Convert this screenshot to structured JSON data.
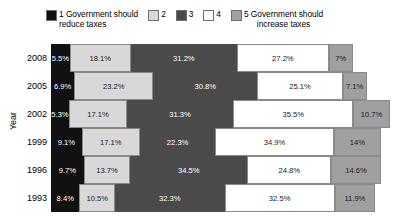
{
  "legend": {
    "items": [
      {
        "key": "1",
        "label": "1 Government should\nreduce taxes",
        "color": "#111111",
        "centered": false
      },
      {
        "key": "2",
        "label": "2",
        "color": "#d8d8d8",
        "centered": false
      },
      {
        "key": "3",
        "label": "3",
        "color": "#4a4a4a",
        "centered": false
      },
      {
        "key": "4",
        "label": "4",
        "color": "#ffffff",
        "centered": false
      },
      {
        "key": "5",
        "label": "5 Government should\nincrease taxes",
        "color": "#a0a0a0",
        "centered": true
      }
    ]
  },
  "axis": {
    "y_title": "Year"
  },
  "chart_data": {
    "type": "bar",
    "orientation": "horizontal",
    "stacked": true,
    "stack_total": 100,
    "title": "",
    "xlabel": "",
    "ylabel": "Year",
    "xlim": [
      0,
      100
    ],
    "grid": false,
    "legend_position": "top",
    "categories": [
      "2008",
      "2005",
      "2002",
      "1999",
      "1996",
      "1993"
    ],
    "series": [
      {
        "name": "1 Government should reduce taxes",
        "color": "#111111",
        "values": [
          5.5,
          6.9,
          5.3,
          9.1,
          9.7,
          8.4
        ]
      },
      {
        "name": "2",
        "color": "#d8d8d8",
        "values": [
          18.1,
          23.2,
          17.1,
          17.1,
          13.7,
          10.5
        ]
      },
      {
        "name": "3",
        "color": "#4a4a4a",
        "values": [
          31.2,
          30.8,
          31.3,
          22.3,
          34.5,
          32.3
        ]
      },
      {
        "name": "4",
        "color": "#ffffff",
        "values": [
          27.2,
          25.1,
          35.5,
          34.9,
          24.8,
          32.5
        ]
      },
      {
        "name": "5 Government should increase taxes",
        "color": "#a0a0a0",
        "values": [
          7,
          7.1,
          10.7,
          14,
          14.6,
          11.9
        ]
      }
    ],
    "rows": [
      {
        "year": "2008",
        "segments": [
          {
            "cat": "1",
            "value": 5.5,
            "label": "5.5%"
          },
          {
            "cat": "2",
            "value": 18.1,
            "label": "18.1%"
          },
          {
            "cat": "3",
            "value": 31.2,
            "label": "31.2%"
          },
          {
            "cat": "4",
            "value": 27.2,
            "label": "27.2%"
          },
          {
            "cat": "5",
            "value": 7,
            "label": "7%"
          }
        ]
      },
      {
        "year": "2005",
        "segments": [
          {
            "cat": "1",
            "value": 6.9,
            "label": "6.9%"
          },
          {
            "cat": "2",
            "value": 23.2,
            "label": "23.2%"
          },
          {
            "cat": "3",
            "value": 30.8,
            "label": "30.8%"
          },
          {
            "cat": "4",
            "value": 25.1,
            "label": "25.1%"
          },
          {
            "cat": "5",
            "value": 7.1,
            "label": "7.1%"
          }
        ]
      },
      {
        "year": "2002",
        "segments": [
          {
            "cat": "1",
            "value": 5.3,
            "label": "5.3%"
          },
          {
            "cat": "2",
            "value": 17.1,
            "label": "17.1%"
          },
          {
            "cat": "3",
            "value": 31.3,
            "label": "31.3%"
          },
          {
            "cat": "4",
            "value": 35.5,
            "label": "35.5%"
          },
          {
            "cat": "5",
            "value": 10.7,
            "label": "10.7%"
          }
        ]
      },
      {
        "year": "1999",
        "segments": [
          {
            "cat": "1",
            "value": 9.1,
            "label": "9.1%"
          },
          {
            "cat": "2",
            "value": 17.1,
            "label": "17.1%"
          },
          {
            "cat": "3",
            "value": 22.3,
            "label": "22.3%"
          },
          {
            "cat": "4",
            "value": 34.9,
            "label": "34.9%"
          },
          {
            "cat": "5",
            "value": 14,
            "label": "14%"
          }
        ]
      },
      {
        "year": "1996",
        "segments": [
          {
            "cat": "1",
            "value": 9.7,
            "label": "9.7%"
          },
          {
            "cat": "2",
            "value": 13.7,
            "label": "13.7%"
          },
          {
            "cat": "3",
            "value": 34.5,
            "label": "34.5%"
          },
          {
            "cat": "4",
            "value": 24.8,
            "label": "24.8%"
          },
          {
            "cat": "5",
            "value": 14.6,
            "label": "14.6%"
          }
        ]
      },
      {
        "year": "1993",
        "segments": [
          {
            "cat": "1",
            "value": 8.4,
            "label": "8.4%"
          },
          {
            "cat": "2",
            "value": 10.5,
            "label": "10.5%"
          },
          {
            "cat": "3",
            "value": 32.3,
            "label": "32.3%"
          },
          {
            "cat": "4",
            "value": 32.5,
            "label": "32.5%"
          },
          {
            "cat": "5",
            "value": 11.9,
            "label": "11.9%"
          }
        ]
      }
    ]
  }
}
